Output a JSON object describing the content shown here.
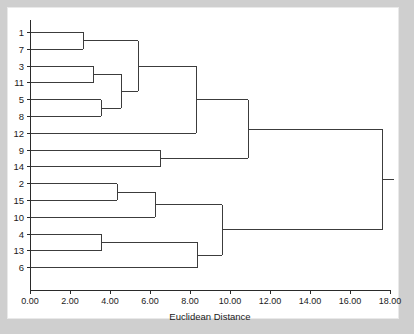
{
  "figure": {
    "background_color": "#cfcfcf",
    "paper_color": "#ffffff",
    "line_color": "#3c3c3c",
    "axis_color": "#2a2a2a",
    "text_color": "#1a1a1a"
  },
  "chart_data": {
    "type": "line",
    "subtype": "dendrogram",
    "title": "",
    "xlabel": "Euclidean Distance",
    "ylabel": "",
    "xlim": [
      0.0,
      18.0
    ],
    "xticks": [
      0.0,
      2.0,
      4.0,
      6.0,
      8.0,
      10.0,
      12.0,
      14.0,
      16.0,
      18.0
    ],
    "xtick_labels": [
      "0.00",
      "2.00",
      "4.00",
      "6.00",
      "8.00",
      "10.00",
      "12.00",
      "14.00",
      "16.00",
      "18.00"
    ],
    "grid": false,
    "legend": "none",
    "orientation": "horizontal",
    "leaf_order": [
      "1",
      "7",
      "3",
      "11",
      "5",
      "8",
      "12",
      "9",
      "14",
      "2",
      "15",
      "10",
      "4",
      "13",
      "6"
    ],
    "leaf_labels": [
      "1",
      "7",
      "3",
      "11",
      "5",
      "8",
      "12",
      "9",
      "14",
      "2",
      "15",
      "10",
      "4",
      "13",
      "6"
    ],
    "merges": [
      {
        "id": "m1",
        "members": [
          "1",
          "7"
        ],
        "height": 2.65
      },
      {
        "id": "m2",
        "members": [
          "3",
          "11"
        ],
        "height": 3.15
      },
      {
        "id": "m3",
        "members": [
          "5",
          "8"
        ],
        "height": 3.55
      },
      {
        "id": "m4",
        "members": [
          "3",
          "11",
          "5",
          "8"
        ],
        "height": 4.55
      },
      {
        "id": "m5",
        "members": [
          "1",
          "7",
          "3",
          "11",
          "5",
          "8"
        ],
        "height": 5.4
      },
      {
        "id": "m6",
        "members": [
          "1",
          "7",
          "3",
          "11",
          "5",
          "8",
          "12"
        ],
        "height": 8.3
      },
      {
        "id": "m7",
        "members": [
          "9",
          "14"
        ],
        "height": 6.5
      },
      {
        "id": "m8",
        "members": [
          "1",
          "7",
          "3",
          "11",
          "5",
          "8",
          "12",
          "9",
          "14"
        ],
        "height": 10.9
      },
      {
        "id": "m9",
        "members": [
          "2",
          "15"
        ],
        "height": 4.35
      },
      {
        "id": "m10",
        "members": [
          "2",
          "15",
          "10"
        ],
        "height": 6.25
      },
      {
        "id": "m11",
        "members": [
          "4",
          "13"
        ],
        "height": 3.55
      },
      {
        "id": "m12",
        "members": [
          "4",
          "13",
          "6"
        ],
        "height": 8.35
      },
      {
        "id": "m13",
        "members": [
          "2",
          "15",
          "10",
          "4",
          "13",
          "6"
        ],
        "height": 9.6
      },
      {
        "id": "m14",
        "members": [
          "1",
          "7",
          "3",
          "11",
          "5",
          "8",
          "12",
          "9",
          "14",
          "2",
          "15",
          "10",
          "4",
          "13",
          "6"
        ],
        "height": 17.6
      }
    ]
  }
}
